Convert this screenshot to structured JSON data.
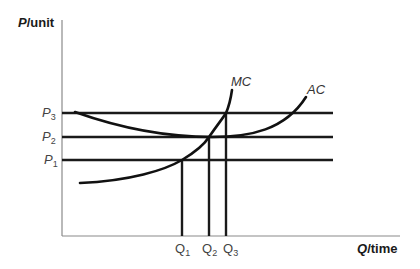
{
  "diagram": {
    "type": "cost-curves",
    "y_axis": {
      "title_italic": "P",
      "title_rest": "/unit"
    },
    "x_axis": {
      "title_italic": "Q",
      "title_rest": "/time"
    },
    "price_levels": [
      {
        "name": "P",
        "sub": "1"
      },
      {
        "name": "P",
        "sub": "2"
      },
      {
        "name": "P",
        "sub": "3"
      }
    ],
    "quantity_levels": [
      {
        "name": "Q",
        "sub": "1"
      },
      {
        "name": "Q",
        "sub": "2"
      },
      {
        "name": "Q",
        "sub": "3"
      }
    ],
    "curves": [
      {
        "id": "mc",
        "label": "MC",
        "description": "Marginal cost, upward sloping, crosses AC at its minimum"
      },
      {
        "id": "ac",
        "label": "AC",
        "description": "Average cost, U-shaped, minimum at P2/Q2"
      }
    ]
  }
}
